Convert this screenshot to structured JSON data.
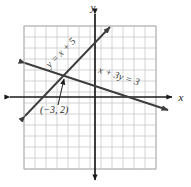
{
  "figure": {
    "kind": "coordinate-plane-graph",
    "background_color": "#ffffff",
    "grid_color": "#c9c9c9",
    "grid_border_color": "#b0b0b0",
    "axis_color": "#1a1a1a",
    "line_color": "#3d3d3d",
    "axis_labels": {
      "x": "x",
      "y": "y"
    },
    "grid": {
      "cell_size_px": 11,
      "columns": 12,
      "rows": 13,
      "left_px": 24,
      "top_px": 26,
      "right_px": 156,
      "bottom_px": 169,
      "show_tick_numbers": false
    },
    "origin": {
      "x_px": 95,
      "y_px": 97
    },
    "lines": [
      {
        "name": "line-y-equals-x-plus-5",
        "label": "y = x + 5",
        "equation": "y = x + 5",
        "slope": 1,
        "intercept": 5,
        "label_rotation_deg": -45,
        "label_x_px": 63,
        "label_y_px": 55,
        "arrow_both_ends": true,
        "x1_px": 25,
        "y1_px": 116,
        "x2_px": 110,
        "y2_px": 27
      },
      {
        "name": "line-x-plus-3y-equals-3",
        "label": "x + 3y = 3",
        "equation": "x + 3y = 3",
        "slope": -0.3333,
        "intercept": 1,
        "label_rotation_deg": 18,
        "label_x_px": 118,
        "label_y_px": 79,
        "arrow_both_ends": true,
        "x1_px": 25,
        "y1_px": 63,
        "x2_px": 168,
        "y2_px": 110
      }
    ],
    "points": [
      {
        "name": "intersection-point",
        "label": "(−3, 2)",
        "coords": [
          -3,
          2
        ],
        "x_px": 62,
        "y_px": 75,
        "label_x_px": 40,
        "label_y_px": 113,
        "pointer_from_x_px": 58,
        "pointer_from_y_px": 105,
        "pointer_to_x_px": 64,
        "pointer_to_y_px": 79
      }
    ]
  }
}
